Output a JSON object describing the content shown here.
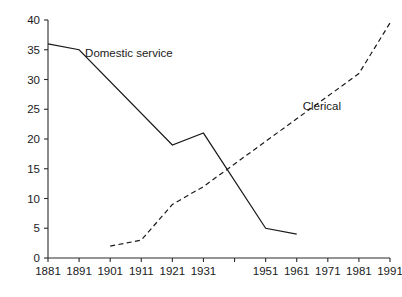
{
  "chart_data": {
    "type": "line",
    "title": "",
    "subtitle": "",
    "xlabel": "",
    "ylabel": "",
    "xlim": [
      1881,
      1991
    ],
    "ylim": [
      0,
      40
    ],
    "grid": false,
    "legend": "inline-annotations",
    "x_ticks": [
      1881,
      1891,
      1901,
      1911,
      1921,
      1931,
      1941,
      1951,
      1961,
      1971,
      1981,
      1991
    ],
    "x_tick_labels": [
      "1881",
      "1891",
      "1901",
      "1911",
      "1921",
      "1931",
      "",
      "1951",
      "1961",
      "1971",
      "1981",
      "1991"
    ],
    "y_ticks": [
      0,
      5,
      10,
      15,
      20,
      25,
      30,
      35,
      40
    ],
    "y_tick_labels": [
      "0",
      "5",
      "10",
      "15",
      "20",
      "25",
      "30",
      "35",
      "40"
    ],
    "series": [
      {
        "name": "Domestic service",
        "style": "solid",
        "color": "#1a1a1a",
        "label_x": 1891,
        "label_y": 34.5,
        "points": [
          {
            "x": 1881,
            "y": 36
          },
          {
            "x": 1891,
            "y": 35
          },
          {
            "x": 1921,
            "y": 19
          },
          {
            "x": 1931,
            "y": 21
          },
          {
            "x": 1951,
            "y": 5
          },
          {
            "x": 1961,
            "y": 4
          }
        ]
      },
      {
        "name": "Clerical",
        "style": "dashed",
        "color": "#1a1a1a",
        "label_x": 1961,
        "label_y": 25.5,
        "points": [
          {
            "x": 1901,
            "y": 2
          },
          {
            "x": 1911,
            "y": 3
          },
          {
            "x": 1921,
            "y": 9
          },
          {
            "x": 1931,
            "y": 12
          },
          {
            "x": 1981,
            "y": 31
          },
          {
            "x": 1991,
            "y": 39.5
          }
        ]
      }
    ],
    "annotations": [
      {
        "text": "Domestic service",
        "x": 1891,
        "y": 34.5
      },
      {
        "text": "Clerical",
        "x": 1961,
        "y": 25.5
      }
    ]
  }
}
